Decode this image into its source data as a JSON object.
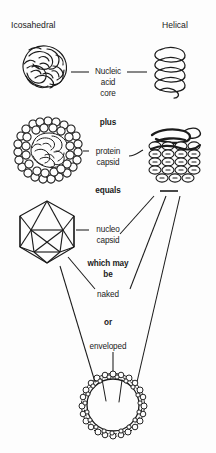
{
  "figure": {
    "title_left": "Icosahedral",
    "title_right": "Helical",
    "background_color": "#fdfdfd",
    "ink_color": "#1b1b1b"
  },
  "columns": {
    "left": {
      "label": "Icosahedral"
    },
    "right": {
      "label": "Helical"
    }
  },
  "center_labels": {
    "nucleic_acid_core_line1": "Nucleic",
    "nucleic_acid_core_line2": "acid",
    "nucleic_acid_core_line3": "core",
    "plus": "plus",
    "protein_capsid_line1": "protein",
    "protein_capsid_line2": "capsid",
    "equals": "equals",
    "nucleo_capsid_line1": "nucleo",
    "nucleo_capsid_line2": "capsid",
    "which_may_be_line1": "which may",
    "which_may_be_line2": "be",
    "naked": "naked",
    "or": "or",
    "enveloped": "enveloped"
  },
  "diagram_elements": {
    "left_nucleic_acid": "tangled-nucleic-acid-ball",
    "right_nucleic_acid": "helical-nucleic-acid-coil",
    "left_capsid": "hexagonal-capsomere-ring-with-nucleic-acid",
    "right_capsid": "stacked-helical-capsomere-rows",
    "left_nucleocapsid": "icosahedron-wireframe",
    "enveloped_virion": "circular-envelope-with-spikes"
  }
}
